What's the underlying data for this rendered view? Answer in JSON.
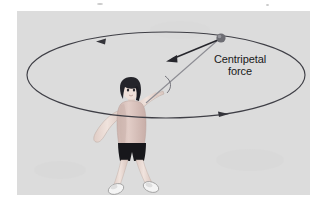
{
  "figure": {
    "background_color": "#ffffff",
    "panel_color": "#dcdcdc",
    "panel": {
      "x": 17,
      "y": 11,
      "width": 293,
      "height": 184
    }
  },
  "labels": {
    "force_line1": "Centripetal",
    "force_line2": "force"
  },
  "diagram": {
    "stroke_color": "#3a3a42",
    "circular_path": {
      "name": "orbit-ellipse",
      "center_x": 166,
      "center_y": 75,
      "radius_x": 139,
      "radius_y": 43,
      "direction": "counterclockwise"
    },
    "direction_arrows": [
      {
        "name": "orbit-arrow-top-left",
        "x": 101,
        "y": 41,
        "points": "left"
      },
      {
        "name": "orbit-arrow-bottom-right",
        "x": 222,
        "y": 114,
        "points": "right"
      }
    ],
    "ball": {
      "name": "ball",
      "x": 221,
      "y": 38,
      "radius": 4.5,
      "color": "#6e6e74"
    },
    "string": {
      "name": "string",
      "from_x": 146,
      "from_y": 103,
      "to_x": 218,
      "to_y": 40
    },
    "force_vector": {
      "name": "centripetal-force-arrow",
      "from_x": 218,
      "from_y": 40,
      "to_x": 166,
      "to_y": 61,
      "label": "Centripetal force",
      "direction": "toward center"
    },
    "angle_arc": {
      "name": "angle-arc",
      "x": 168,
      "y": 82
    }
  },
  "person": {
    "name": "person-swinging-ball",
    "hair_color": "#2b2b2f",
    "skin_color": "#e8d7cf",
    "shirt_color": "#d9c2bc",
    "shorts_color": "#141418",
    "shoe_color": "#f2f2f2",
    "head": {
      "x": 131,
      "y": 89
    },
    "torso": {
      "x": 131,
      "y": 120
    },
    "raised_arm_side": "right"
  }
}
